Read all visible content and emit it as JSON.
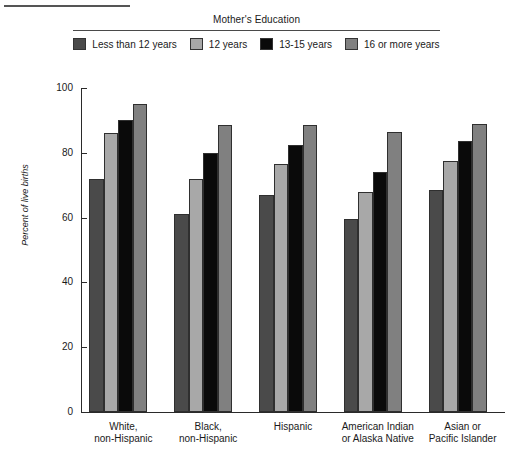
{
  "legend": {
    "title": "Mother's Education",
    "items": [
      {
        "label": "Less than 12 years",
        "color": "#4a4a4a"
      },
      {
        "label": "12 years",
        "color": "#a8a8a8"
      },
      {
        "label": "13-15 years",
        "color": "#0a0a0a"
      },
      {
        "label": "16 or more years",
        "color": "#808080"
      }
    ]
  },
  "chart_data": {
    "type": "bar",
    "title": "Mother's Education",
    "xlabel": "",
    "ylabel": "Percent of live births",
    "ylim": [
      0,
      100
    ],
    "yticks": [
      0,
      20,
      40,
      60,
      80,
      100
    ],
    "grid": false,
    "legend_position": "top",
    "categories": [
      "White,\nnon-Hispanic",
      "Black,\nnon-Hispanic",
      "Hispanic",
      "American Indian\nor Alaska Native",
      "Asian or\nPacific Islander"
    ],
    "category_lines": [
      [
        "White,",
        "non-Hispanic"
      ],
      [
        "Black,",
        "non-Hispanic"
      ],
      [
        "Hispanic",
        ""
      ],
      [
        "American Indian",
        "or Alaska Native"
      ],
      [
        "Asian or",
        "Pacific Islander"
      ]
    ],
    "series": [
      {
        "name": "Less than 12 years",
        "color": "#4a4a4a",
        "values": [
          72,
          61,
          67,
          59.5,
          68.5
        ]
      },
      {
        "name": "12 years",
        "color": "#a8a8a8",
        "values": [
          86,
          72,
          76.5,
          68,
          77.5
        ]
      },
      {
        "name": "13-15 years",
        "color": "#0a0a0a",
        "values": [
          90,
          80,
          82.5,
          74,
          83.5
        ]
      },
      {
        "name": "16 or more years",
        "color": "#808080",
        "values": [
          95,
          88.5,
          88.5,
          86.5,
          89
        ]
      }
    ]
  }
}
